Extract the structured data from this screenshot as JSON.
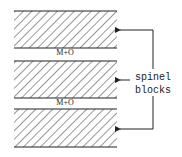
{
  "diagram": {
    "title": "",
    "colors": {
      "stroke": "#222222",
      "hatch": "#333333",
      "background": "#ffffff"
    },
    "blocks": [
      {
        "name": "spinel-block-top",
        "y_top": 11,
        "y_bottom": 48
      },
      {
        "name": "spinel-block-middle",
        "y_top": 61,
        "y_bottom": 98
      },
      {
        "name": "spinel-block-bottom",
        "y_top": 109,
        "y_bottom": 147
      }
    ],
    "layers": [
      {
        "label": "M+O",
        "y": 55
      },
      {
        "label": "M+O",
        "y": 104
      }
    ],
    "annotation": {
      "line1": "spinel",
      "line2": "blocks",
      "arrows_to_y": [
        30,
        80,
        129
      ]
    }
  }
}
